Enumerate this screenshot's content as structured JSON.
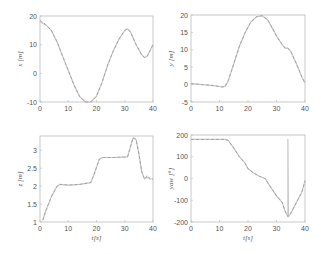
{
  "figure": {
    "background": "#ffffff",
    "axis_color": "#bbbbbb",
    "line_color_actual": "#c8c8c8",
    "line_color_reference": "#9a9a9a"
  },
  "chart_data": [
    {
      "id": "x",
      "type": "line",
      "title": "",
      "xlabel": "",
      "ylabel": "x [m]",
      "xlim": [
        0,
        40
      ],
      "ylim": [
        -10,
        20
      ],
      "xticks": [
        "0",
        "10",
        "20",
        "30",
        "40"
      ],
      "yticks": [
        "-10",
        "0",
        "10",
        "20"
      ],
      "grid": false,
      "series": [
        {
          "name": "actual",
          "style": "solid",
          "x": [
            0,
            2,
            4,
            6,
            8,
            10,
            12,
            14,
            16,
            18,
            20,
            22,
            24,
            26,
            28,
            30,
            31,
            32,
            34,
            36,
            37,
            38,
            40
          ],
          "y": [
            18,
            17,
            15,
            11,
            6,
            1,
            -4,
            -8,
            -10,
            -10,
            -8,
            -3,
            3,
            8,
            12,
            15,
            15.5,
            14.5,
            10,
            6.5,
            5.5,
            6,
            10
          ]
        },
        {
          "name": "reference",
          "style": "dashed",
          "x": [
            0,
            2,
            4,
            6,
            8,
            10,
            12,
            14,
            16,
            18,
            20,
            22,
            24,
            26,
            28,
            30,
            31,
            32,
            34,
            36,
            37,
            38,
            40
          ],
          "y": [
            18.5,
            17,
            15,
            11,
            6,
            1,
            -4,
            -8,
            -10,
            -10,
            -8,
            -3,
            3,
            8,
            12,
            15,
            15.5,
            14.5,
            10,
            6.5,
            5.5,
            6,
            10
          ]
        }
      ]
    },
    {
      "id": "y",
      "type": "line",
      "title": "",
      "xlabel": "",
      "ylabel": "y [m]",
      "xlim": [
        0,
        40
      ],
      "ylim": [
        -5,
        20
      ],
      "xticks": [
        "0",
        "10",
        "20",
        "30",
        "40"
      ],
      "yticks": [
        "-5",
        "0",
        "5",
        "10",
        "15",
        "20"
      ],
      "grid": false,
      "series": [
        {
          "name": "actual",
          "style": "solid",
          "x": [
            0,
            4,
            8,
            11,
            12,
            13,
            15,
            17,
            19,
            21,
            23,
            25,
            27,
            28,
            30,
            32,
            33,
            34,
            35,
            37,
            39,
            40
          ],
          "y": [
            0.3,
            0,
            -0.3,
            -0.7,
            -0.5,
            1,
            6,
            11,
            15,
            18,
            19.5,
            19.8,
            18.5,
            17,
            14,
            11.5,
            10.5,
            10.5,
            9.5,
            6,
            2,
            0.5
          ]
        },
        {
          "name": "reference",
          "style": "dashed",
          "x": [
            0,
            4,
            8,
            11,
            12,
            13,
            15,
            17,
            19,
            21,
            23,
            25,
            27,
            28,
            30,
            32,
            33,
            34,
            35,
            37,
            39,
            40
          ],
          "y": [
            0.3,
            0,
            -0.3,
            -0.7,
            -0.5,
            1,
            6,
            11,
            15,
            18,
            19.5,
            19.8,
            18.5,
            17,
            14,
            11.5,
            10.5,
            10.5,
            9.5,
            6,
            2,
            0.5
          ]
        }
      ]
    },
    {
      "id": "z",
      "type": "line",
      "title": "",
      "xlabel": "t[s]",
      "ylabel": "z [m]",
      "xlim": [
        0,
        40
      ],
      "ylim": [
        1,
        3.4
      ],
      "xticks": [
        "0",
        "10",
        "20",
        "30",
        "40"
      ],
      "yticks": [
        "1",
        "1.5",
        "2",
        "2.5",
        "3"
      ],
      "grid": false,
      "series": [
        {
          "name": "actual",
          "style": "solid",
          "x": [
            1,
            2,
            4,
            6,
            7,
            10,
            14,
            18,
            19,
            21,
            22,
            26,
            31,
            32,
            33,
            34,
            35,
            36,
            37,
            38,
            39,
            40
          ],
          "y": [
            1.05,
            1.3,
            1.7,
            2.0,
            2.05,
            2.03,
            2.05,
            2.1,
            2.3,
            2.75,
            2.8,
            2.8,
            2.82,
            3.1,
            3.35,
            3.3,
            2.9,
            2.4,
            2.2,
            2.25,
            2.2,
            2.2
          ]
        },
        {
          "name": "reference",
          "style": "dashed",
          "x": [
            1,
            2,
            4,
            6,
            7,
            10,
            14,
            18,
            19,
            21,
            22,
            26,
            31,
            32,
            33,
            34,
            35,
            36,
            37,
            38,
            39,
            40
          ],
          "y": [
            1.05,
            1.3,
            1.7,
            2.0,
            2.05,
            2.03,
            2.05,
            2.1,
            2.3,
            2.75,
            2.8,
            2.8,
            2.82,
            3.1,
            3.35,
            3.3,
            2.9,
            2.4,
            2.2,
            2.3,
            2.2,
            2.2
          ]
        }
      ]
    },
    {
      "id": "yaw",
      "type": "line",
      "title": "",
      "xlabel": "t[s]",
      "ylabel": "yaw [°]",
      "xlim": [
        0,
        40
      ],
      "ylim": [
        -200,
        200
      ],
      "xticks": [
        "0",
        "10",
        "20",
        "30",
        "40"
      ],
      "yticks": [
        "-200",
        "-100",
        "0",
        "100",
        "200"
      ],
      "grid": false,
      "series": [
        {
          "name": "actual",
          "style": "solid",
          "x": [
            0,
            12,
            13,
            15,
            17,
            19,
            20,
            22,
            24,
            26,
            27,
            29,
            30,
            32,
            33,
            34,
            34,
            34.2,
            35,
            37,
            39,
            40
          ],
          "y": [
            180,
            180,
            175,
            140,
            100,
            70,
            45,
            25,
            10,
            0,
            -20,
            -60,
            -80,
            -110,
            -150,
            -175,
            180,
            -175,
            -160,
            -110,
            -60,
            -10
          ]
        },
        {
          "name": "reference",
          "style": "dashed",
          "x": [
            0,
            12,
            13,
            15,
            17,
            19,
            20,
            22,
            24,
            26,
            27,
            29,
            30,
            32,
            33,
            34,
            35,
            37,
            39,
            40
          ],
          "y": [
            180,
            180,
            175,
            140,
            100,
            70,
            45,
            25,
            10,
            0,
            -20,
            -60,
            -80,
            -110,
            -150,
            -175,
            -160,
            -110,
            -60,
            -10
          ]
        }
      ]
    }
  ]
}
